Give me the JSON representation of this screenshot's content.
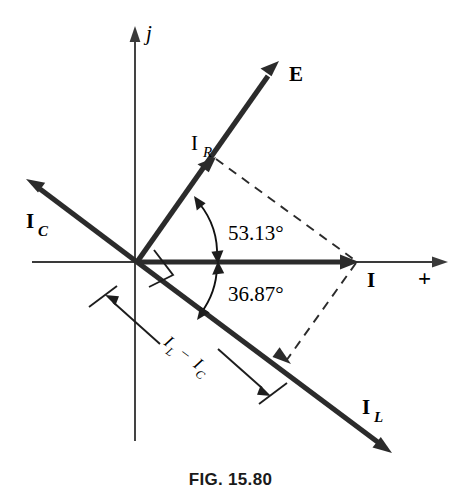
{
  "figure": {
    "caption": "FIG. 15.80",
    "axes": {
      "imaginary_label": "j",
      "real_label": "+"
    },
    "phasors": [
      {
        "key": "E",
        "label": "E",
        "sub": "",
        "angle_deg": 53.13,
        "description": "source voltage phasor"
      },
      {
        "key": "IR",
        "label": "I",
        "sub": "R",
        "angle_deg": 53.13,
        "description": "resistive branch current"
      },
      {
        "key": "IC",
        "label": "I",
        "sub": "C",
        "angle_deg": 143.13,
        "description": "capacitive branch current"
      },
      {
        "key": "IL",
        "label": "I",
        "sub": "L",
        "angle_deg": -36.87,
        "description": "inductive branch current"
      },
      {
        "key": "I",
        "label": "I",
        "sub": "",
        "angle_deg": 0,
        "description": "total source current"
      }
    ],
    "angles": [
      {
        "key": "theta_up",
        "value": "53.13°",
        "from": "real-axis",
        "to": "IR"
      },
      {
        "key": "theta_down",
        "value": "36.87°",
        "from": "real-axis",
        "to": "IL"
      }
    ],
    "dimension": {
      "label_left": "I",
      "label_left_sub": "L",
      "label_minus": "−",
      "label_right": "I",
      "label_right_sub": "C",
      "full_text": "I_L − I_C"
    },
    "right_angle_marker": "90° between I_R and I_L",
    "colors": {
      "phasor": "#2b2b2b",
      "axis": "#3a3a3a",
      "dashed": "#2b2b2b",
      "text": "#000000",
      "background": "#ffffff"
    }
  }
}
